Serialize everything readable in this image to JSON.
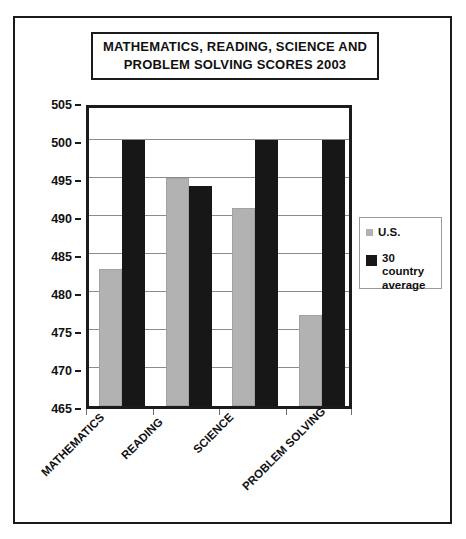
{
  "chart_data": {
    "type": "bar",
    "title": "MATHEMATICS, READING, SCIENCE AND\nPROBLEM SOLVING SCORES 2003",
    "categories": [
      "MATHEMATICS",
      "READING",
      "SCIENCE",
      "PROBLEM SOLVING"
    ],
    "series": [
      {
        "name": "U.S.",
        "values": [
          483,
          495,
          491,
          477
        ],
        "color": "#b2b2b2"
      },
      {
        "name": "30 country average",
        "values": [
          500,
          494,
          500,
          500
        ],
        "color": "#171717"
      }
    ],
    "xlabel": "",
    "ylabel": "",
    "ylim": [
      465,
      505
    ],
    "ytick_step": 5,
    "yticks": [
      465,
      470,
      475,
      480,
      485,
      490,
      495,
      500,
      505
    ],
    "grid": true,
    "legend_position": "right"
  },
  "legend": {
    "entries": [
      {
        "label": "U.S.",
        "swatch": "us"
      },
      {
        "label": "30 country average",
        "swatch": "avg"
      }
    ]
  }
}
